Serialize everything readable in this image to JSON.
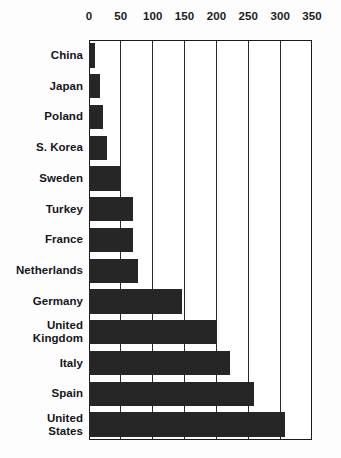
{
  "chart_data": {
    "type": "bar",
    "orientation": "horizontal",
    "title": "",
    "subtitle": "",
    "xlabel": "",
    "ylabel": "",
    "xlim": [
      0,
      350
    ],
    "ylim": null,
    "grid": true,
    "legend": null,
    "legend_position": "none",
    "annotations": [],
    "axis_position": "top",
    "tick_labels": [
      "0",
      "50",
      "100",
      "150",
      "200",
      "250",
      "300",
      "350"
    ],
    "ticks": [
      0,
      50,
      100,
      150,
      200,
      250,
      300,
      350
    ],
    "categories": [
      "China",
      "Japan",
      "Poland",
      "S. Korea",
      "Sweden",
      "Turkey",
      "France",
      "Netherlands",
      "Germany",
      "United Kingdom",
      "Italy",
      "Spain",
      "United States"
    ],
    "category_lines": [
      [
        "China"
      ],
      [
        "Japan"
      ],
      [
        "Poland"
      ],
      [
        "S. Korea"
      ],
      [
        "Sweden"
      ],
      [
        "Turkey"
      ],
      [
        "France"
      ],
      [
        "Netherlands"
      ],
      [
        "Germany"
      ],
      [
        "United",
        "Kingdom"
      ],
      [
        "Italy"
      ],
      [
        "Spain"
      ],
      [
        "United",
        "States"
      ]
    ],
    "values": [
      10,
      18,
      22,
      28,
      51,
      69,
      69,
      77,
      146,
      200,
      221,
      259,
      308
    ]
  },
  "style": {
    "bar_color": "#262626",
    "axis_color": "#1b1b1b",
    "grid_color": "#2a2a2a",
    "label_color": "#15151c",
    "background": "#fdfdfd",
    "plot_background": "#ffffff"
  }
}
